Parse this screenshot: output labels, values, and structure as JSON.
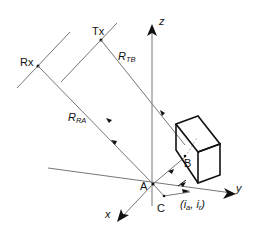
{
  "diagram": {
    "labels": {
      "rx": "Rx",
      "tx": "Tx",
      "r_tb": "R",
      "r_tb_sub": "TB",
      "r_ra": "R",
      "r_ra_sub": "RA",
      "z_axis": "z",
      "y_axis": "y",
      "x_axis": "x",
      "point_a": "A",
      "point_b": "B",
      "point_c": "C",
      "coords": "(i",
      "coords_a": "a",
      "coords_sep": ", i",
      "coords_r": "r",
      "coords_close": ")"
    },
    "colors": {
      "line": "#777777",
      "box": "#111111",
      "text": "#111111"
    }
  }
}
